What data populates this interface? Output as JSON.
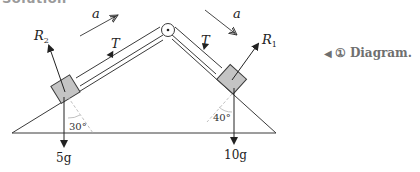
{
  "header": {
    "text": "Solution"
  },
  "diagram": {
    "labels": {
      "accel_left": "a",
      "accel_right": "a",
      "tension_left": "T",
      "tension_right": "T",
      "reaction_left": "R",
      "reaction_left_sub": "2",
      "reaction_right": "R",
      "reaction_right_sub": "1",
      "angle_left": "30°",
      "angle_right": "40°",
      "weight_left": "5g",
      "weight_right": "10g"
    },
    "colors": {
      "line": "#3a3a3a",
      "block_fill": "#c4c4c4",
      "dashed": "#b9b9b9"
    }
  },
  "caption": {
    "marker": "◀",
    "number": "①",
    "text": "Diagram."
  }
}
